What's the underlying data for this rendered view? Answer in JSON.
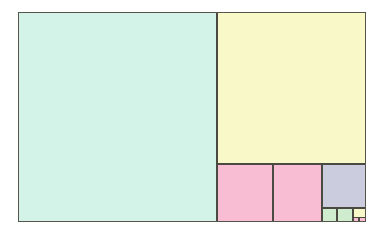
{
  "figure": {
    "type": "squared-rectangle",
    "stroke_color": "#4a4a42",
    "frame_color": "#55554c",
    "background_color": "#ffffff",
    "frame": {
      "x": 0,
      "y": 0,
      "width": 348,
      "height": 210,
      "unit_px": 9.93,
      "width_units": 34,
      "height_units": 21
    },
    "palette": {
      "teal": "#d3f2e8",
      "yellow": "#f8f8c8",
      "pink": "#f9bdd3",
      "lavender": "#ccccdf",
      "green": "#cfeccf"
    },
    "squares": [
      {
        "name": "square-21-teal",
        "size_units": 21,
        "color": "#d3f2e8",
        "x": 0,
        "y": 0,
        "w": 199,
        "h": 210
      },
      {
        "name": "square-13-yellow",
        "size_units": 13,
        "color": "#f8f8c8",
        "x": 199,
        "y": 0,
        "w": 149,
        "h": 152
      },
      {
        "name": "square-8-pink-left",
        "size_units": 8,
        "color": "#f9bdd3",
        "x": 199,
        "y": 152,
        "w": 56,
        "h": 58
      },
      {
        "name": "square-8-pink-right",
        "size_units": 8,
        "color": "#f9bdd3",
        "x": 255,
        "y": 152,
        "w": 49,
        "h": 58
      },
      {
        "name": "square-5-lavender",
        "size_units": 5,
        "color": "#ccccdf",
        "x": 304,
        "y": 152,
        "w": 44,
        "h": 44
      },
      {
        "name": "square-3-green-left",
        "size_units": 3,
        "color": "#cfeccf",
        "x": 304,
        "y": 196,
        "w": 15,
        "h": 14
      },
      {
        "name": "square-3-green-right",
        "size_units": 3,
        "color": "#cfeccf",
        "x": 319,
        "y": 196,
        "w": 16,
        "h": 14
      },
      {
        "name": "square-2-yellow",
        "size_units": 2,
        "color": "#f8f8c8",
        "x": 335,
        "y": 196,
        "w": 13,
        "h": 13
      },
      {
        "name": "square-1-pink-a",
        "size_units": 1,
        "color": "#f9bdd3",
        "x": 335,
        "y": 205,
        "w": 6,
        "h": 5
      },
      {
        "name": "square-1-pink-b",
        "size_units": 1,
        "color": "#f9bdd3",
        "x": 341,
        "y": 205,
        "w": 7,
        "h": 5
      }
    ]
  }
}
